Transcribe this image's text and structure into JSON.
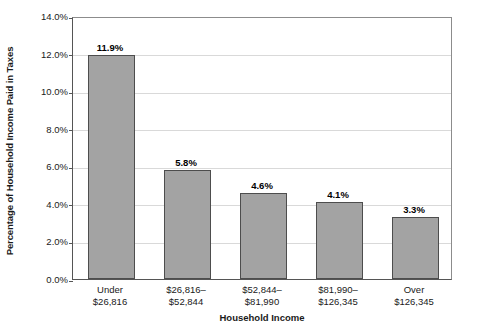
{
  "chart_data": {
    "type": "bar",
    "title": "",
    "xlabel": "Household Income",
    "ylabel": "Percentage of Household Income Paid in Taxes",
    "categories": [
      "Under\n$26,816",
      "$26,816–\n$52,844",
      "$52,844–\n$81,990",
      "$81,990–\n$126,345",
      "Over\n$126,345"
    ],
    "category_lines": [
      [
        "Under",
        "$26,816"
      ],
      [
        "$26,816–",
        "$52,844"
      ],
      [
        "$52,844–",
        "$81,990"
      ],
      [
        "$81,990–",
        "$126,345"
      ],
      [
        "Over",
        "$126,345"
      ]
    ],
    "values": [
      11.9,
      5.8,
      4.6,
      4.1,
      3.3
    ],
    "value_labels": [
      "11.9%",
      "5.8%",
      "4.6%",
      "4.1%",
      "3.3%"
    ],
    "ylim": [
      0,
      14
    ],
    "ytick_values": [
      0,
      2,
      4,
      6,
      8,
      10,
      12,
      14
    ],
    "ytick_labels": [
      "0.0%",
      "2.0%",
      "4.0%",
      "6.0%",
      "8.0%",
      "10.0%",
      "12.0%",
      "14.0%"
    ],
    "grid": true,
    "grid_axis": "y",
    "legend": false,
    "bar_color": "#a3a3a3",
    "bar_border_color": "#4d4d4d",
    "axis_color": "#555555",
    "gridline_color": "#d9d9d9"
  }
}
